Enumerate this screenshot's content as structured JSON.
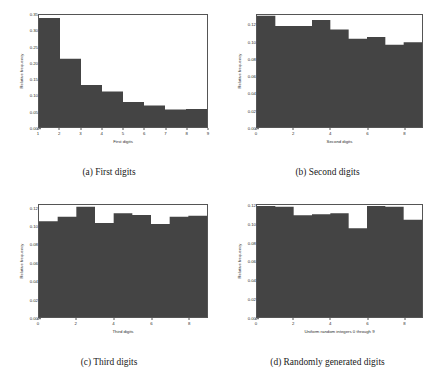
{
  "figure": {
    "ylabel": "Relative frequency",
    "bar_color": "#444444",
    "axis_color": "#555555",
    "background": "#ffffff"
  },
  "panels": [
    {
      "id": "panel-a",
      "caption": "(a) First digits",
      "xlabel": "First digits",
      "ylabel": "Relative frequency",
      "yticks": [
        "0.00",
        "0.05",
        "0.10",
        "0.15",
        "0.20",
        "0.25",
        "0.30",
        "0.35"
      ],
      "ytick_values": [
        0.0,
        0.05,
        0.1,
        0.15,
        0.2,
        0.25,
        0.3,
        0.35
      ],
      "xticks": [
        "1",
        "2",
        "3",
        "4",
        "5",
        "6",
        "7",
        "8",
        "9"
      ],
      "xtick_values": [
        1,
        2,
        3,
        4,
        5,
        6,
        7,
        8,
        9
      ]
    },
    {
      "id": "panel-b",
      "caption": "(b) Second digits",
      "xlabel": "Second digits",
      "ylabel": "Relative frequency",
      "yticks": [
        "0.00",
        "0.02",
        "0.04",
        "0.06",
        "0.08",
        "0.10",
        "0.12"
      ],
      "ytick_values": [
        0.0,
        0.02,
        0.04,
        0.06,
        0.08,
        0.1,
        0.12
      ],
      "xticks": [
        "0",
        "2",
        "4",
        "6",
        "8"
      ],
      "xtick_values": [
        0,
        2,
        4,
        6,
        8
      ]
    },
    {
      "id": "panel-c",
      "caption": "(c) Third digits",
      "xlabel": "Third digits",
      "ylabel": "Relative frequency",
      "yticks": [
        "0.00",
        "0.02",
        "0.04",
        "0.06",
        "0.08",
        "0.10",
        "0.12"
      ],
      "ytick_values": [
        0.0,
        0.02,
        0.04,
        0.06,
        0.08,
        0.1,
        0.12
      ],
      "xticks": [
        "0",
        "2",
        "4",
        "6",
        "8"
      ],
      "xtick_values": [
        0,
        2,
        4,
        6,
        8
      ]
    },
    {
      "id": "panel-d",
      "caption": "(d) Randomly generated digits",
      "xlabel": "Uniform random integers 0 through 9",
      "ylabel": "Relative frequency",
      "yticks": [
        "0.00",
        "0.02",
        "0.04",
        "0.06",
        "0.08",
        "0.10",
        "0.12"
      ],
      "ytick_values": [
        0.0,
        0.02,
        0.04,
        0.06,
        0.08,
        0.1,
        0.12
      ],
      "xticks": [
        "0",
        "2",
        "4",
        "6",
        "8"
      ],
      "xtick_values": [
        0,
        2,
        4,
        6,
        8
      ]
    }
  ],
  "chart_data": [
    {
      "type": "bar",
      "title": "(a) First digits",
      "xlabel": "First digits",
      "ylabel": "Relative frequency",
      "categories": [
        "1",
        "2",
        "3",
        "4",
        "5",
        "6",
        "7",
        "8"
      ],
      "bin_edges": [
        1,
        2,
        3,
        4,
        5,
        6,
        7,
        8,
        9
      ],
      "values": [
        0.341,
        0.213,
        0.131,
        0.111,
        0.078,
        0.067,
        0.055,
        0.056
      ],
      "xlim": [
        1,
        9
      ],
      "ylim": [
        0.0,
        0.35
      ],
      "grid": false,
      "legend": false
    },
    {
      "type": "bar",
      "title": "(b) Second digits",
      "xlabel": "Second digits",
      "ylabel": "Relative frequency",
      "categories": [
        "0",
        "1",
        "2",
        "3",
        "4",
        "5",
        "6",
        "7",
        "8"
      ],
      "bin_edges": [
        0,
        1,
        2,
        3,
        4,
        5,
        6,
        7,
        8,
        9
      ],
      "values": [
        0.131,
        0.119,
        0.119,
        0.126,
        0.115,
        0.104,
        0.106,
        0.097,
        0.1
      ],
      "last_partial": 0.086,
      "xlim": [
        0,
        9
      ],
      "ylim": [
        0.0,
        0.132
      ],
      "grid": false,
      "legend": false
    },
    {
      "type": "bar",
      "title": "(c) Third digits",
      "xlabel": "Third digits",
      "ylabel": "Relative frequency",
      "categories": [
        "0",
        "1",
        "2",
        "3",
        "4",
        "5",
        "6",
        "7",
        "8"
      ],
      "bin_edges": [
        0,
        1,
        2,
        3,
        4,
        5,
        6,
        7,
        8,
        9
      ],
      "values": [
        0.106,
        0.111,
        0.122,
        0.104,
        0.115,
        0.113,
        0.103,
        0.111,
        0.112
      ],
      "last_partial": 0.108,
      "xlim": [
        0,
        9
      ],
      "ylim": [
        0.0,
        0.124
      ],
      "grid": false,
      "legend": false
    },
    {
      "type": "bar",
      "title": "(d) Randomly generated digits",
      "xlabel": "Uniform random integers 0 through 9",
      "ylabel": "Relative frequency",
      "categories": [
        "0",
        "1",
        "2",
        "3",
        "4",
        "5",
        "6",
        "7",
        "8"
      ],
      "bin_edges": [
        0,
        1,
        2,
        3,
        4,
        5,
        6,
        7,
        8,
        9
      ],
      "values": [
        0.12,
        0.119,
        0.11,
        0.111,
        0.112,
        0.096,
        0.12,
        0.119,
        0.105
      ],
      "last_partial": 0.104,
      "xlim": [
        0,
        9
      ],
      "ylim": [
        0.0,
        0.121
      ],
      "grid": false,
      "legend": false
    }
  ]
}
